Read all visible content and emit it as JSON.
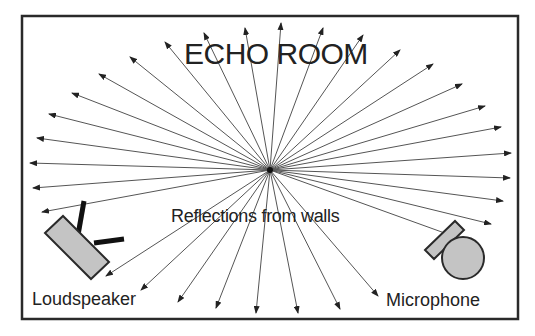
{
  "diagram": {
    "title": "ECHO ROOM",
    "caption": "Reflections from walls",
    "labels": {
      "speaker": "Loudspeaker",
      "microphone": "Microphone"
    },
    "colors": {
      "border": "#2a2a2a",
      "ray": "#555555",
      "device_fill": "#c4c4c4",
      "device_stroke": "#2a2a2a",
      "text": "#222222"
    },
    "room": {
      "x": 22,
      "y": 16,
      "width": 496,
      "height": 303
    },
    "ray_origin": {
      "x": 270,
      "y": 170
    },
    "ray_tips": [
      [
        30,
        163
      ],
      [
        37,
        138
      ],
      [
        49,
        114
      ],
      [
        72,
        93
      ],
      [
        99,
        74
      ],
      [
        130,
        57
      ],
      [
        165,
        42
      ],
      [
        204,
        33
      ],
      [
        245,
        28
      ],
      [
        281,
        23
      ],
      [
        323,
        28
      ],
      [
        363,
        35
      ],
      [
        400,
        50
      ],
      [
        433,
        64
      ],
      [
        462,
        84
      ],
      [
        485,
        106
      ],
      [
        501,
        127
      ],
      [
        511,
        153
      ],
      [
        510,
        178
      ],
      [
        503,
        201
      ],
      [
        491,
        224
      ],
      [
        475,
        244
      ],
      [
        378,
        296
      ],
      [
        340,
        309
      ],
      [
        298,
        313
      ],
      [
        256,
        313
      ],
      [
        216,
        308
      ],
      [
        178,
        302
      ],
      [
        141,
        290
      ],
      [
        106,
        276
      ],
      [
        33,
        188
      ],
      [
        42,
        212
      ]
    ]
  }
}
